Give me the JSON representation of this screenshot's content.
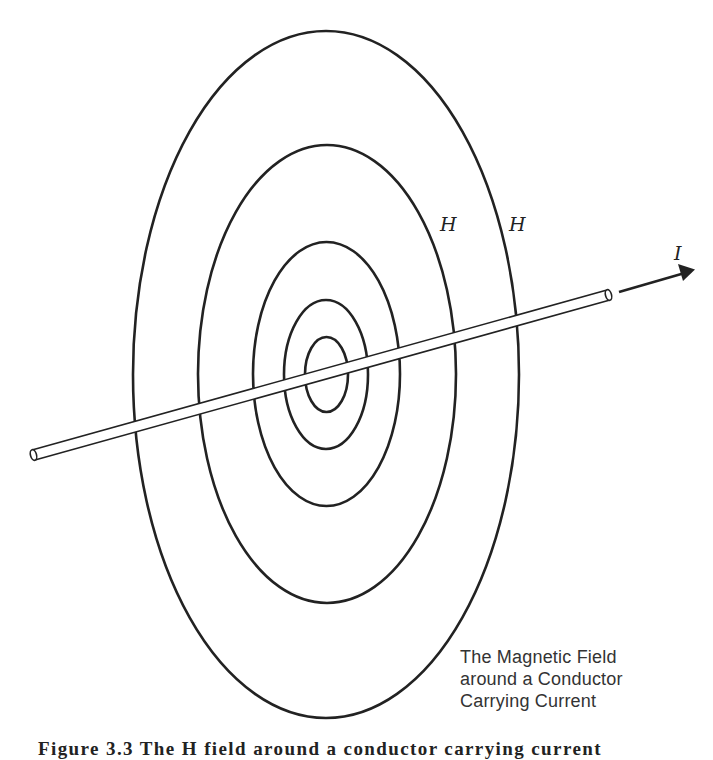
{
  "figure": {
    "title_annotation": [
      "The Magnetic Field",
      "around a Conductor",
      "Carrying Current"
    ],
    "caption_partial": "Figure 3.3 The H field around a conductor carrying current",
    "labels": {
      "field_label_inner": "H",
      "field_label_outer": "H",
      "current_label": "I"
    },
    "field_lines": [
      {
        "name": "field-line-1",
        "cx": 326,
        "cy": 374,
        "rx": 21,
        "ry": 37
      },
      {
        "name": "field-line-2",
        "cx": 326,
        "cy": 374,
        "rx": 42,
        "ry": 74
      },
      {
        "name": "field-line-3",
        "cx": 326,
        "cy": 374,
        "rx": 73,
        "ry": 132
      },
      {
        "name": "field-line-4",
        "cx": 327,
        "cy": 374,
        "rx": 129,
        "ry": 229
      },
      {
        "name": "field-line-5",
        "cx": 326,
        "cy": 374,
        "rx": 193,
        "ry": 343
      }
    ],
    "conductor": {
      "start": [
        33,
        455
      ],
      "end": [
        608,
        295
      ]
    },
    "current_arrow": {
      "start": [
        619,
        292
      ],
      "end": [
        694,
        270
      ]
    },
    "colors": {
      "ink": "#222222",
      "annotation_ink": "#333333",
      "background": "#ffffff"
    }
  }
}
